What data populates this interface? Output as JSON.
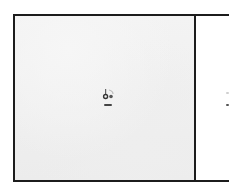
{
  "window": {
    "frame_color": "#1c1c1c",
    "main_panel_bg": "#f0f0f0",
    "side_panel_bg": "#ffffff"
  },
  "main_panel": {
    "center_item": {
      "icon": "desktop-file-icon",
      "caption": ""
    }
  },
  "side_panel": {
    "marks": [
      {
        "name": "scroll-mark-light",
        "color": "#cfcfcf"
      },
      {
        "name": "scroll-mark-dark",
        "color": "#555555"
      }
    ]
  }
}
